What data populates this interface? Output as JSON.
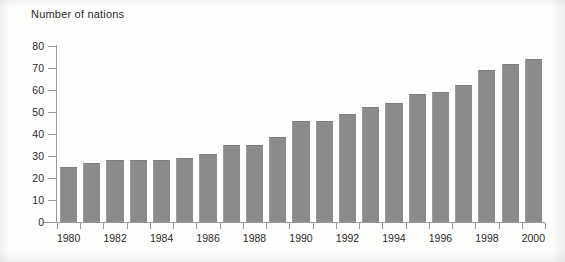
{
  "chart_data": {
    "type": "bar",
    "title": "Number of nations",
    "xlabel": "",
    "ylabel": "",
    "ylim": [
      0,
      80
    ],
    "ytick_step": 10,
    "yticks": [
      0,
      10,
      20,
      30,
      40,
      50,
      60,
      70,
      80
    ],
    "grid": false,
    "legend": "none",
    "bar_color": "#8b8b8b",
    "axis_color": "#9a9a9a",
    "text_color": "#2b2b2b",
    "background": "#fdfdfc",
    "categories": [
      "1980",
      "1981",
      "1982",
      "1983",
      "1984",
      "1985",
      "1986",
      "1987",
      "1988",
      "1989",
      "1990",
      "1991",
      "1992",
      "1993",
      "1994",
      "1995",
      "1996",
      "1997",
      "1998",
      "1999",
      "2000"
    ],
    "values": [
      25,
      27,
      28,
      28,
      28,
      29,
      31,
      35,
      35,
      38.5,
      46,
      46,
      49,
      52.5,
      54,
      58,
      59,
      62.5,
      69,
      72,
      74
    ],
    "xtick_labels": [
      "1980",
      "1982",
      "1984",
      "1986",
      "1988",
      "1990",
      "1992",
      "1994",
      "1996",
      "1998",
      "2000"
    ]
  }
}
